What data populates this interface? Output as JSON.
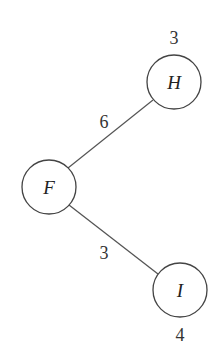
{
  "diagram": {
    "type": "tree",
    "nodes": [
      {
        "id": "H",
        "label": "H",
        "value": "3",
        "cx": 174,
        "cy": 82,
        "r": 27,
        "value_pos": {
          "x": 174,
          "y": 44
        }
      },
      {
        "id": "F",
        "label": "F",
        "value": "",
        "cx": 49,
        "cy": 187,
        "r": 27
      },
      {
        "id": "I",
        "label": "I",
        "value": "4",
        "cx": 180,
        "cy": 290,
        "r": 27,
        "value_pos": {
          "x": 180,
          "y": 341
        }
      }
    ],
    "edges": [
      {
        "from": "F",
        "to": "H",
        "weight": "6",
        "label_pos": {
          "x": 104,
          "y": 128
        }
      },
      {
        "from": "F",
        "to": "I",
        "weight": "3",
        "label_pos": {
          "x": 104,
          "y": 259
        }
      }
    ]
  }
}
